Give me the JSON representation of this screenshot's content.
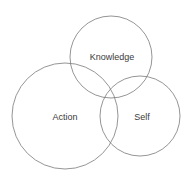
{
  "diagram": {
    "type": "venn",
    "stroke_color": "#7a7a7a",
    "circles": [
      {
        "label": "Knowledge",
        "cx": 111,
        "cy": 57,
        "r": 41
      },
      {
        "label": "Action",
        "cx": 65,
        "cy": 116,
        "r": 53
      },
      {
        "label": "Self",
        "cx": 140,
        "cy": 116,
        "r": 40
      }
    ]
  }
}
